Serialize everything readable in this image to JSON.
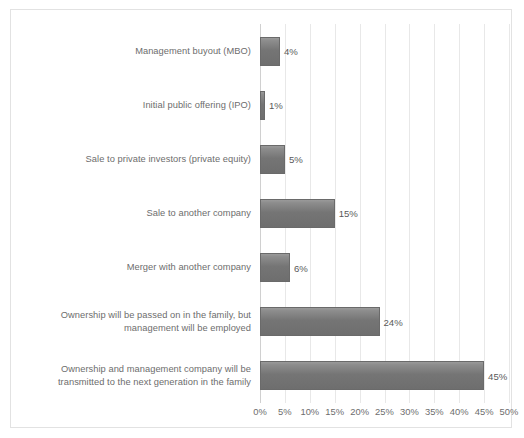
{
  "chart_data": {
    "type": "bar",
    "orientation": "horizontal",
    "title": "",
    "subtitle": "",
    "xlabel": "",
    "ylabel": "",
    "xlim": [
      0,
      50
    ],
    "grid": true,
    "legend": false,
    "units": "%",
    "categories": [
      "Management buyout (MBO)",
      "Initial public offering (IPO)",
      "Sale to private investors (private equity)",
      "Sale to another company",
      "Merger with another company",
      "Ownership will be passed on in the family, but\nmanagement will be employed",
      "Ownership and management company will be\ntransmitted to the next generation in the family"
    ],
    "values": [
      4,
      1,
      5,
      15,
      6,
      24,
      45
    ],
    "data_labels": [
      "4%",
      "1%",
      "5%",
      "15%",
      "6%",
      "24%",
      "45%"
    ],
    "tick_labels": [
      "0%",
      "5%",
      "10%",
      "15%",
      "20%",
      "25%",
      "30%",
      "35%",
      "40%",
      "45%",
      "50%"
    ],
    "tick_values": [
      0,
      5,
      10,
      15,
      20,
      25,
      30,
      35,
      40,
      45,
      50
    ],
    "colors": {
      "bar": "#757575",
      "bar_border": "#6a6a6a",
      "gridline": "#e8e8e8",
      "axis_line": "#d0d0d0",
      "label_text": "#6d6d6d",
      "value_text": "#595959",
      "plot_background": "#ffffff",
      "frame_border": "#e2e2e2"
    }
  }
}
